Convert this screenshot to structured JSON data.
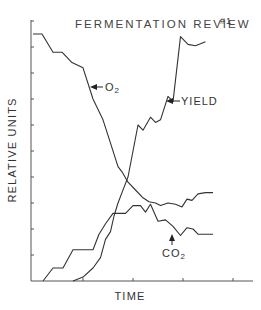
{
  "chart_data": {
    "type": "line",
    "title": "FERMENTATION REVIEW",
    "title_suffix": "#1",
    "xlabel": "TIME",
    "ylabel": "RELATIVE UNITS",
    "xlim": [
      0,
      4.4
    ],
    "ylim": [
      0,
      10
    ],
    "x_ticks": [
      1,
      2,
      3,
      4
    ],
    "y_ticks": [
      1,
      2,
      3,
      4,
      5,
      6,
      7,
      8,
      9,
      10
    ],
    "grid": false,
    "series": [
      {
        "name": "O2",
        "label": "O",
        "label_sub": "2",
        "points": [
          [
            0,
            9.5
          ],
          [
            0.18,
            9.5
          ],
          [
            0.4,
            8.8
          ],
          [
            0.58,
            8.8
          ],
          [
            0.78,
            8.4
          ],
          [
            1.0,
            8.2
          ],
          [
            1.2,
            7.0
          ],
          [
            1.4,
            6.2
          ],
          [
            1.55,
            5.3
          ],
          [
            1.7,
            4.4
          ],
          [
            1.78,
            4.2
          ],
          [
            1.9,
            3.8
          ],
          [
            2.05,
            3.5
          ],
          [
            2.2,
            3.2
          ],
          [
            2.32,
            3.05
          ],
          [
            2.45,
            3.0
          ],
          [
            2.55,
            2.9
          ],
          [
            2.7,
            3.0
          ],
          [
            2.85,
            2.95
          ],
          [
            2.98,
            2.85
          ],
          [
            3.08,
            3.15
          ],
          [
            3.18,
            3.1
          ],
          [
            3.3,
            3.35
          ],
          [
            3.45,
            3.4
          ],
          [
            3.6,
            3.4
          ]
        ]
      },
      {
        "name": "CO2",
        "label": "CO",
        "label_sub": "2",
        "points": [
          [
            0.2,
            0
          ],
          [
            0.4,
            0.5
          ],
          [
            0.6,
            0.5
          ],
          [
            0.8,
            1.2
          ],
          [
            1.2,
            1.2
          ],
          [
            1.32,
            1.8
          ],
          [
            1.45,
            2.2
          ],
          [
            1.6,
            2.6
          ],
          [
            1.72,
            2.6
          ],
          [
            1.85,
            2.6
          ],
          [
            2.0,
            2.9
          ],
          [
            2.15,
            2.9
          ],
          [
            2.25,
            2.65
          ],
          [
            2.35,
            2.95
          ],
          [
            2.5,
            2.3
          ],
          [
            2.65,
            2.35
          ],
          [
            2.8,
            2.1
          ],
          [
            2.95,
            1.75
          ],
          [
            3.08,
            2.05
          ],
          [
            3.2,
            2.0
          ],
          [
            3.3,
            1.8
          ],
          [
            3.6,
            1.8
          ]
        ]
      },
      {
        "name": "YIELD",
        "label": "YIELD",
        "points": [
          [
            0.8,
            0
          ],
          [
            1.0,
            0.15
          ],
          [
            1.2,
            0.5
          ],
          [
            1.35,
            0.9
          ],
          [
            1.45,
            1.6
          ],
          [
            1.55,
            1.9
          ],
          [
            1.62,
            2.5
          ],
          [
            1.7,
            3.0
          ],
          [
            1.82,
            3.6
          ],
          [
            1.9,
            4.0
          ],
          [
            2.0,
            5.0
          ],
          [
            2.1,
            6.0
          ],
          [
            2.2,
            5.8
          ],
          [
            2.35,
            6.3
          ],
          [
            2.45,
            6.1
          ],
          [
            2.55,
            6.2
          ],
          [
            2.7,
            7.1
          ],
          [
            2.8,
            6.9
          ],
          [
            2.95,
            9.4
          ],
          [
            3.1,
            9.1
          ],
          [
            3.25,
            9.05
          ],
          [
            3.45,
            9.2
          ]
        ]
      }
    ],
    "annotations": [
      {
        "text": "O",
        "sub": "2",
        "points_to": "O2"
      },
      {
        "text": "YIELD",
        "points_to": "YIELD"
      },
      {
        "text": "CO",
        "sub": "2",
        "points_to": "CO2"
      }
    ]
  }
}
